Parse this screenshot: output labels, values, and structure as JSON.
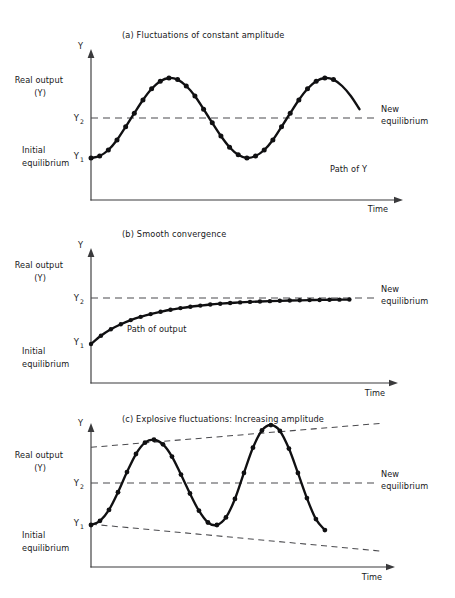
{
  "figure": {
    "background": "#ffffff",
    "ink": "#101012",
    "dash_color": "#4a4a4e"
  },
  "chart_data": [
    {
      "id": "panel-a",
      "type": "line",
      "title": "(a)  Fluctuations of constant amplitude",
      "xlabel": "Time",
      "ylabel": "Y",
      "grid": false,
      "legend": "none",
      "y_ticks": [
        {
          "label": "Y",
          "sub": "1",
          "value": 0
        },
        {
          "label": "Y",
          "sub": "2",
          "value": 1
        }
      ],
      "side_labels": [
        {
          "text": "Real output",
          "value": 2.35
        },
        {
          "text": "(Y)",
          "value": 2.05
        },
        {
          "text": "Initial",
          "value": 0.25
        },
        {
          "text": "equilibrium",
          "value": -0.05
        }
      ],
      "annotations": [
        {
          "text": "New",
          "role": "new-equilibrium-line-label-1"
        },
        {
          "text": "equilibrium",
          "role": "new-equilibrium-line-label-2"
        },
        {
          "text": "Path of Y",
          "role": "series-label"
        }
      ],
      "reference_lines": [
        {
          "name": "new-equilibrium",
          "value": 1.0,
          "style": "dashed"
        }
      ],
      "series": [
        {
          "name": "Path of Y",
          "description": "constant-amplitude sine wave about the new equilibrium",
          "x": [
            0.0,
            0.3,
            0.6,
            0.9,
            1.2,
            1.5,
            1.8,
            2.1,
            2.4,
            2.7,
            3.0,
            3.3,
            3.6,
            3.9,
            4.2,
            4.5,
            4.8,
            5.1,
            5.4,
            5.7,
            6.0,
            6.3,
            6.6,
            6.9,
            7.2,
            7.5,
            7.8,
            8.1,
            8.4
          ],
          "y": [
            0.0,
            0.05,
            0.2,
            0.45,
            0.78,
            1.12,
            1.45,
            1.73,
            1.92,
            2.0,
            1.96,
            1.8,
            1.55,
            1.22,
            0.88,
            0.55,
            0.27,
            0.08,
            0.0,
            0.05,
            0.2,
            0.45,
            0.78,
            1.12,
            1.45,
            1.73,
            1.92,
            2.0,
            1.96
          ],
          "markers": true,
          "marker_indices": [
            0,
            1,
            2,
            3,
            4,
            5,
            6,
            7,
            8,
            9,
            10,
            11,
            12,
            13,
            14,
            15,
            16,
            17,
            18,
            19,
            20,
            21,
            22,
            23,
            24,
            25,
            26,
            27
          ],
          "tail": {
            "x": [
              8.4,
              8.7,
              9.0,
              9.3
            ],
            "y": [
              1.96,
              1.8,
              1.55,
              1.22
            ]
          }
        }
      ],
      "xlim": [
        0,
        10.6
      ],
      "ylim": [
        -0.85,
        2.75
      ]
    },
    {
      "id": "panel-b",
      "type": "line",
      "title": "(b)  Smooth convergence",
      "xlabel": "Time",
      "ylabel": "Y",
      "grid": false,
      "legend": "none",
      "y_ticks": [
        {
          "label": "Y",
          "sub": "1",
          "value": 0
        },
        {
          "label": "Y",
          "sub": "2",
          "value": 1
        }
      ],
      "side_labels": [
        {
          "text": "Real output",
          "value": 2.1
        },
        {
          "text": "(Y)",
          "value": 1.8
        },
        {
          "text": "Initial",
          "value": -0.35
        },
        {
          "text": "equilibrium",
          "value": -0.65
        }
      ],
      "annotations": [
        {
          "text": "New",
          "role": "new-equilibrium-line-label-1"
        },
        {
          "text": "equilibrium",
          "role": "new-equilibrium-line-label-2"
        },
        {
          "text": "Path of output",
          "role": "series-label"
        }
      ],
      "reference_lines": [
        {
          "name": "new-equilibrium",
          "value": 1.0,
          "style": "dashed"
        }
      ],
      "series": [
        {
          "name": "Path of output",
          "description": "exponential approach from Y1 up to Y2",
          "x": [
            0.0,
            0.35,
            0.7,
            1.05,
            1.4,
            1.75,
            2.1,
            2.45,
            2.8,
            3.15,
            3.5,
            3.85,
            4.2,
            4.55,
            4.9,
            5.25,
            5.6,
            5.95,
            6.3,
            6.65,
            7.0,
            7.35,
            7.7,
            8.05,
            8.4,
            8.75,
            9.1
          ],
          "y": [
            0.0,
            0.18,
            0.32,
            0.43,
            0.52,
            0.59,
            0.65,
            0.7,
            0.745,
            0.78,
            0.81,
            0.835,
            0.858,
            0.876,
            0.891,
            0.904,
            0.915,
            0.924,
            0.932,
            0.939,
            0.945,
            0.95,
            0.954,
            0.958,
            0.961,
            0.964,
            0.966
          ],
          "markers": true
        }
      ],
      "xlim": [
        0,
        10.6
      ],
      "ylim": [
        -1.2,
        2.45
      ]
    },
    {
      "id": "panel-c",
      "type": "line",
      "title": "(c)  Explosive fluctuations: Increasing amplitude",
      "xlabel": "Time",
      "ylabel": "Y",
      "grid": false,
      "legend": "none",
      "y_ticks": [
        {
          "label": "Y",
          "sub": "1",
          "value": 0
        },
        {
          "label": "Y",
          "sub": "2",
          "value": 1.0
        }
      ],
      "side_labels": [
        {
          "text": "Real output",
          "value": 2.0
        },
        {
          "text": "(Y)",
          "value": 1.72
        },
        {
          "text": "Initial",
          "value": -0.62
        },
        {
          "text": "equilibrium",
          "value": -0.92
        }
      ],
      "annotations": [
        {
          "text": "New",
          "role": "new-equilibrium-line-label-1"
        },
        {
          "text": "equilibrium",
          "role": "new-equilibrium-line-label-2"
        }
      ],
      "reference_lines": [
        {
          "name": "new-equilibrium",
          "value": 1.0,
          "style": "dashed"
        },
        {
          "name": "upper-envelope",
          "style": "dashed",
          "from": [
            0.0,
            1.85
          ],
          "to": [
            10.3,
            2.42
          ]
        },
        {
          "name": "lower-envelope",
          "style": "dashed",
          "from": [
            0.0,
            0.02
          ],
          "to": [
            10.3,
            -0.62
          ]
        }
      ],
      "series": [
        {
          "name": "Explosive path",
          "description": "sine wave with growing amplitude, envelopes diverging",
          "x": [
            0.0,
            0.32,
            0.64,
            0.96,
            1.28,
            1.6,
            1.92,
            2.24,
            2.56,
            2.88,
            3.2,
            3.52,
            3.84,
            4.16,
            4.48,
            4.8,
            5.12,
            5.44,
            5.76,
            6.08,
            6.4,
            6.72,
            7.04,
            7.36,
            7.68,
            8.0,
            8.32
          ],
          "y": [
            0.0,
            0.1,
            0.36,
            0.78,
            1.26,
            1.69,
            1.96,
            2.03,
            1.92,
            1.63,
            1.2,
            0.75,
            0.34,
            0.06,
            0.0,
            0.18,
            0.62,
            1.24,
            1.84,
            2.25,
            2.38,
            2.24,
            1.82,
            1.24,
            0.64,
            0.14,
            -0.12
          ],
          "markers": true
        }
      ],
      "xlim": [
        0,
        10.6
      ],
      "ylim": [
        -1.35,
        2.75
      ]
    }
  ],
  "panels": [
    {
      "key": "a",
      "title": "(a)  Fluctuations of constant amplitude",
      "y_axis_label": "Y",
      "x_axis_label": "Time",
      "tick1": "Y",
      "tick1_sub": "1",
      "tick2": "Y",
      "tick2_sub": "2",
      "side1": "Real output",
      "side2": "(Y)",
      "side3": "Initial",
      "side4": "equilibrium",
      "annot1": "New",
      "annot2": "equilibrium",
      "annot3": "Path of Y"
    },
    {
      "key": "b",
      "title": "(b)  Smooth convergence",
      "y_axis_label": "Y",
      "x_axis_label": "Time",
      "tick1": "Y",
      "tick1_sub": "1",
      "tick2": "Y",
      "tick2_sub": "2",
      "side1": "Real output",
      "side2": "(Y)",
      "side3": "Initial",
      "side4": "equilibrium",
      "annot1": "New",
      "annot2": "equilibrium",
      "annot3": "Path of output"
    },
    {
      "key": "c",
      "title": "(c)  Explosive fluctuations: Increasing amplitude",
      "y_axis_label": "Y",
      "x_axis_label": "Time",
      "tick1": "Y",
      "tick1_sub": "1",
      "tick2": "Y",
      "tick2_sub": "2",
      "side1": "Real output",
      "side2": "(Y)",
      "side3": "Initial",
      "side4": "equilibrium",
      "annot1": "New",
      "annot2": "equilibrium"
    }
  ]
}
